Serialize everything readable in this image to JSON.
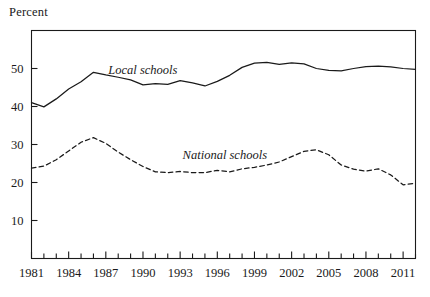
{
  "axis_title": "Percent",
  "chart_data": {
    "type": "line",
    "title": "",
    "subtitle": "",
    "xlabel": "",
    "ylabel": "Percent",
    "ylim": [
      0,
      60
    ],
    "xlim": [
      1981,
      2012
    ],
    "yticks": [
      10,
      20,
      30,
      40,
      50
    ],
    "xticks": [
      1981,
      1984,
      1987,
      1990,
      1993,
      1996,
      1999,
      2002,
      2005,
      2008,
      2011
    ],
    "xticks_minor_every": 1,
    "grid": false,
    "frame": "box",
    "legend_position": "inline-annotations",
    "x": [
      1981,
      1982,
      1983,
      1984,
      1985,
      1986,
      1987,
      1988,
      1989,
      1990,
      1991,
      1992,
      1993,
      1994,
      1995,
      1996,
      1997,
      1998,
      1999,
      2000,
      2001,
      2002,
      2003,
      2004,
      2005,
      2006,
      2007,
      2008,
      2009,
      2010,
      2011,
      2012
    ],
    "series": [
      {
        "name": "Local schools",
        "style": "solid",
        "color": "#1a1a1a",
        "label_x": 1987.2,
        "label_y": 48.6,
        "values": [
          41.0,
          39.9,
          42.0,
          44.6,
          46.5,
          49.0,
          48.3,
          47.7,
          47.0,
          45.7,
          46.0,
          45.8,
          46.8,
          46.2,
          45.4,
          46.6,
          48.2,
          50.3,
          51.4,
          51.6,
          51.1,
          51.5,
          51.2,
          50.0,
          49.5,
          49.4,
          50.0,
          50.5,
          50.6,
          50.4,
          50.0,
          49.8
        ]
      },
      {
        "name": "National schools",
        "style": "dashed",
        "color": "#1a1a1a",
        "label_x": 1993.2,
        "label_y": 26.2,
        "values": [
          23.8,
          24.3,
          26.0,
          28.3,
          30.6,
          31.8,
          30.3,
          28.0,
          26.0,
          24.2,
          22.8,
          22.6,
          22.9,
          22.6,
          22.6,
          23.2,
          22.8,
          23.6,
          24.0,
          24.6,
          25.4,
          26.8,
          28.2,
          28.6,
          27.3,
          24.6,
          23.5,
          23.0,
          23.6,
          22.0,
          19.4,
          19.8
        ]
      }
    ]
  }
}
